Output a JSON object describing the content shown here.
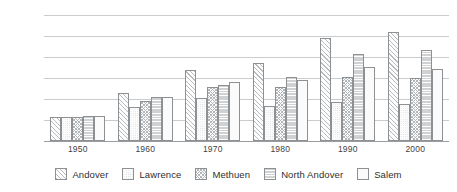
{
  "chart_data": {
    "type": "bar",
    "title": "",
    "xlabel": "",
    "ylabel": "",
    "categories": [
      "1950",
      "1960",
      "1970",
      "1980",
      "1990",
      "2000"
    ],
    "series": [
      {
        "name": "Andover",
        "pattern": "diagonal-hatch",
        "values": [
          23000,
          46000,
          68000,
          74500,
          98000,
          103500
        ]
      },
      {
        "name": "Lawrence",
        "pattern": "light-dotted",
        "values": [
          22500,
          32000,
          40500,
          33500,
          37000,
          35000
        ]
      },
      {
        "name": "Methuen",
        "pattern": "checkered",
        "values": [
          23000,
          38500,
          51500,
          51500,
          61000,
          60000
        ]
      },
      {
        "name": "North Andover",
        "pattern": "horizontal-gray",
        "values": [
          23500,
          41500,
          53500,
          61000,
          83000,
          87000
        ]
      },
      {
        "name": "Salem",
        "pattern": "plain-white",
        "values": [
          23500,
          41500,
          56500,
          58500,
          70500,
          69000
        ]
      }
    ],
    "ylim": [
      0,
      120000
    ],
    "yticks": [
      0,
      20000,
      40000,
      60000,
      80000,
      100000,
      120000
    ],
    "ytick_labels": [
      "0",
      "20,000",
      "40,000",
      "60,000",
      "80,000",
      "100,000",
      "120,000"
    ],
    "grid": true,
    "legend_position": "bottom",
    "gridlines_horizontal_only": true
  },
  "legend": {
    "items": [
      {
        "label": "Andover"
      },
      {
        "label": "Lawrence"
      },
      {
        "label": "Methuen"
      },
      {
        "label": "North Andover"
      },
      {
        "label": "Salem"
      }
    ]
  },
  "colors": {
    "background": "#ffffff",
    "gridline": "#c9ccce",
    "baseline": "#9a9da0",
    "bar_outline": "#8e9193",
    "text": "#3f3f3f",
    "north_andover_fill": "#cfd1d3"
  }
}
